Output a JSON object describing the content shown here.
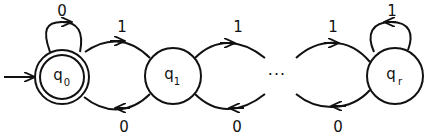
{
  "diagram": {
    "type": "finite-automaton",
    "states": [
      {
        "id": "q0",
        "base": "q",
        "sub": "0",
        "initial": true,
        "accepting": true
      },
      {
        "id": "q1",
        "base": "q",
        "sub": "1",
        "initial": false,
        "accepting": false
      },
      {
        "id": "qr",
        "base": "q",
        "sub": "r",
        "initial": false,
        "accepting": false
      }
    ],
    "ellipsis": "···",
    "transitions": [
      {
        "from": "q0",
        "to": "q0",
        "label": "0"
      },
      {
        "from": "q0",
        "to": "q1",
        "label": "1"
      },
      {
        "from": "q1",
        "to": "q0",
        "label": "0"
      },
      {
        "from": "q1",
        "to": "...",
        "label": "1"
      },
      {
        "from": "...",
        "to": "q1",
        "label": "0"
      },
      {
        "from": "...",
        "to": "qr",
        "label": "1"
      },
      {
        "from": "qr",
        "to": "...",
        "label": "0"
      },
      {
        "from": "qr",
        "to": "qr",
        "label": "1"
      }
    ]
  }
}
